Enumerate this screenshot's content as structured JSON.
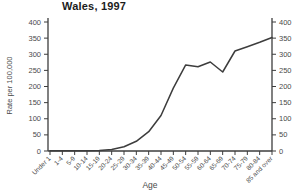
{
  "title": "Wales, 1997",
  "chart_data": {
    "type": "line",
    "title": "Wales, 1997",
    "xlabel": "Age",
    "ylabel": "Rate per 100,000",
    "ylim": [
      0,
      400
    ],
    "ytick_step": 50,
    "grid": false,
    "legend_position": "none",
    "secondary_y_axis": true,
    "categories": [
      "Under 1",
      "1-4",
      "5-9",
      "10-14",
      "15-19",
      "20-24",
      "25-29",
      "30-34",
      "35-39",
      "40-44",
      "45-49",
      "50-54",
      "55-59",
      "60-64",
      "65-69",
      "70-74",
      "75-79",
      "80-84",
      "85 and over"
    ],
    "values": [
      1,
      1,
      1,
      1,
      2,
      5,
      13,
      30,
      60,
      110,
      195,
      267,
      261,
      276,
      245,
      310,
      323,
      337,
      352
    ],
    "colors": {
      "line": "#3d3d3d",
      "axis": "#3d3d3d",
      "tick_text": "#4a4a4a",
      "background": "#ffffff"
    }
  }
}
